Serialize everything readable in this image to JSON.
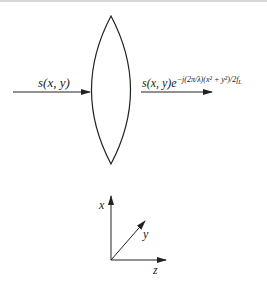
{
  "diagram": {
    "type": "optics-lens-phase",
    "input_label": "s(x, y)",
    "output_label": {
      "base": "s(x, y)e",
      "exponent": "−j(2π/λ)(x² + y²)/2f",
      "exponent_subscript": "L"
    },
    "element": "thin convex lens",
    "axes": {
      "x_label": "x",
      "y_label": "y",
      "z_label": "z"
    },
    "colors": {
      "stroke": "#222222",
      "background": "#ffffff"
    }
  }
}
